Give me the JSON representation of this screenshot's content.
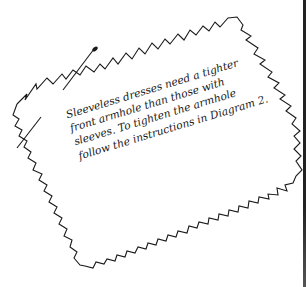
{
  "note": {
    "lines": [
      "Sleeveless dresses need a tighter",
      "front armhole than those with",
      "sleeves. To tighten the armhole",
      "follow the instructions in Diagram 2."
    ]
  },
  "illustration": {
    "description": "pinked-edge fabric swatch with pins",
    "stroke_color": "#1a1a1a"
  }
}
